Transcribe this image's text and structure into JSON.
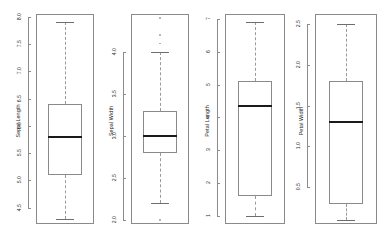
{
  "figure": {
    "background": "#ffffff",
    "line_color": "#8a8a8a",
    "median_color": "#1a1a1a",
    "whisker_style": "dashed",
    "panel_count": 4
  },
  "chart_data": [
    {
      "type": "box",
      "title": "",
      "xlabel": "",
      "ylabel": "Sepal.Length",
      "ylim": [
        4.2,
        8.05
      ],
      "ticks": [
        "4.5",
        "5.0",
        "5.5",
        "6.0",
        "6.5",
        "7.0",
        "7.5",
        "8.0"
      ],
      "tick_values": [
        4.5,
        5.0,
        5.5,
        6.0,
        6.5,
        7.0,
        7.5,
        8.0
      ],
      "grid": false,
      "legend": "none",
      "stats": {
        "min": 4.3,
        "q1": 5.1,
        "median": 5.8,
        "q3": 6.4,
        "max": 7.9
      },
      "outliers": []
    },
    {
      "type": "box",
      "title": "",
      "xlabel": "",
      "ylabel": "Sepal.Width",
      "ylim": [
        1.95,
        4.45
      ],
      "ticks": [
        "2.0",
        "2.5",
        "3.0",
        "3.5",
        "4.0"
      ],
      "tick_values": [
        2.0,
        2.5,
        3.0,
        3.5,
        4.0
      ],
      "grid": false,
      "legend": "none",
      "stats": {
        "min": 2.2,
        "q1": 2.8,
        "median": 3.0,
        "q3": 3.3,
        "max": 4.0
      },
      "outliers": [
        4.1,
        4.2,
        4.4,
        2.0
      ]
    },
    {
      "type": "box",
      "title": "",
      "xlabel": "",
      "ylabel": "Petal.Length",
      "ylim": [
        0.75,
        7.15
      ],
      "ticks": [
        "1",
        "2",
        "3",
        "4",
        "5",
        "6",
        "7"
      ],
      "tick_values": [
        1,
        2,
        3,
        4,
        5,
        6,
        7
      ],
      "grid": false,
      "legend": "none",
      "stats": {
        "min": 1.0,
        "q1": 1.6,
        "median": 4.35,
        "q3": 5.1,
        "max": 6.9
      },
      "outliers": []
    },
    {
      "type": "box",
      "title": "",
      "xlabel": "",
      "ylabel": "Petal.Width",
      "ylim": [
        0.05,
        2.62
      ],
      "ticks": [
        "0.5",
        "1.0",
        "1.5",
        "2.0",
        "2.5"
      ],
      "tick_values": [
        0.5,
        1.0,
        1.5,
        2.0,
        2.5
      ],
      "grid": false,
      "legend": "none",
      "stats": {
        "min": 0.1,
        "q1": 0.3,
        "median": 1.3,
        "q3": 1.8,
        "max": 2.5
      },
      "outliers": []
    }
  ],
  "panels": [
    {
      "label": "Sepal Length",
      "tick_labels": [
        "4.5",
        "5.0",
        "5.5",
        "6.0",
        "6.5",
        "7.0",
        "7.5",
        "8.0"
      ]
    },
    {
      "label": "Sepal Width",
      "tick_labels": [
        "2.0",
        "2.5",
        "3.0",
        "3.5",
        "4.0"
      ]
    },
    {
      "label": "Petal Length",
      "tick_labels": [
        "1",
        "2",
        "3",
        "4",
        "5",
        "6",
        "7"
      ]
    },
    {
      "label": "Petal Width",
      "tick_labels": [
        "0.5",
        "1.0",
        "1.5",
        "2.0",
        "2.5"
      ]
    }
  ]
}
